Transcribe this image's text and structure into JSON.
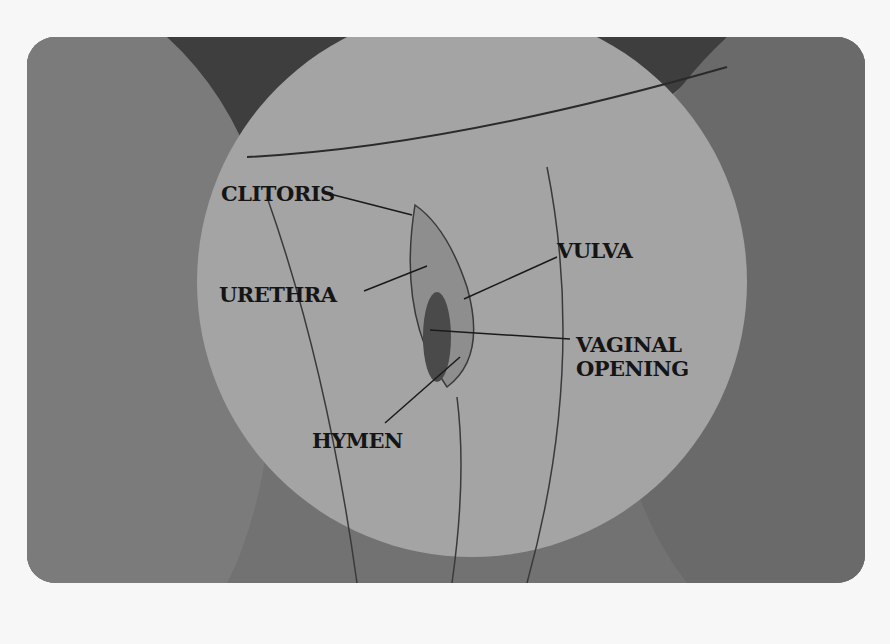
{
  "diagram": {
    "type": "labeled anatomical illustration",
    "labels": {
      "clitoris": "CLITORIS",
      "urethra": "URETHRA",
      "vulva": "VULVA",
      "vaginal_opening_line1": "VAGINAL",
      "vaginal_opening_line2": "OPENING",
      "hymen": "HYMEN"
    },
    "colors": {
      "background": "#f7f7f7",
      "frame_fill": "#6f6f6f",
      "dark_region": "#3e3e3e",
      "inset_circle": "#a3a3a3",
      "label_text": "#151515"
    }
  }
}
